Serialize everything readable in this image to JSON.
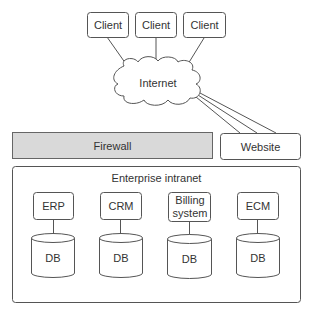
{
  "diagram": {
    "clients": [
      {
        "label": "Client"
      },
      {
        "label": "Client"
      },
      {
        "label": "Client"
      }
    ],
    "cloud": {
      "label": "Internet"
    },
    "firewall": {
      "label": "Firewall",
      "fill": "#d9d9d9"
    },
    "website": {
      "label": "Website"
    },
    "intranet": {
      "label": "Enterprise intranet",
      "systems": [
        {
          "label": "ERP",
          "db": "DB"
        },
        {
          "label": "CRM",
          "db": "DB"
        },
        {
          "label": "Billing system",
          "db": "DB"
        },
        {
          "label": "ECM",
          "db": "DB"
        }
      ]
    },
    "colors": {
      "stroke": "#555555",
      "text": "#333333",
      "firewall_fill": "#d9d9d9"
    }
  }
}
